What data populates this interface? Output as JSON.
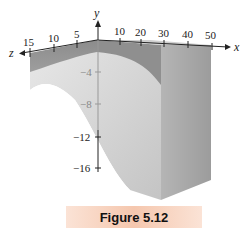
{
  "figure": {
    "caption": "Figure 5.12",
    "caption_bg_color": "#f5c7ae"
  },
  "axes": {
    "x": {
      "label": "x",
      "ticks": [
        "10",
        "20",
        "30",
        "40",
        "50"
      ]
    },
    "y": {
      "label": "y",
      "ticks": [
        "-4",
        "-8",
        "-12",
        "-16"
      ],
      "tick_display": [
        "−4",
        "−8",
        "−12",
        "−16"
      ]
    },
    "z": {
      "label": "z",
      "ticks": [
        "15",
        "10",
        "5"
      ]
    }
  },
  "surface": {
    "top_face_color": "#c9c9c9",
    "front_face_color": "#8a8a8a",
    "side_face_color": "#a8a8a8",
    "curve_surface_color": "#d9d9d9"
  }
}
